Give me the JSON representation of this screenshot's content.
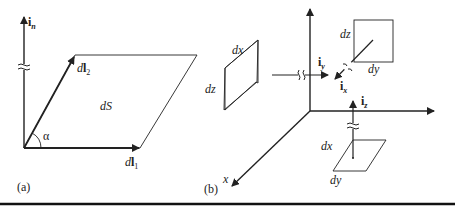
{
  "panel_a": {
    "caption": "(a)",
    "normal_vector": {
      "base": "i",
      "sub": "n"
    },
    "vector1": {
      "prefix": "d",
      "base": "l",
      "sub": "1"
    },
    "vector2": {
      "prefix": "d",
      "base": "l",
      "sub": "2"
    },
    "area": "dS",
    "angle": "α"
  },
  "panel_b": {
    "caption": "(b)",
    "axis_x": "x",
    "plane_yz": {
      "a": "dx",
      "b": "dz",
      "unit": {
        "base": "i",
        "sub": "y"
      }
    },
    "plane_xz": {
      "a": "dz",
      "b": "dy",
      "unit": {
        "base": "i",
        "sub": "x"
      }
    },
    "plane_xy": {
      "a": "dx",
      "b": "dy",
      "unit": {
        "base": "i",
        "sub": "z"
      }
    }
  },
  "colors": {
    "ink": "#222222",
    "background": "#ffffff"
  }
}
